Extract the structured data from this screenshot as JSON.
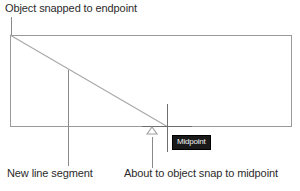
{
  "canvas": {
    "background_color": "#ffffff",
    "width": 300,
    "height": 191
  },
  "annotations": {
    "top_label": "Object snapped to endpoint",
    "bottom_left_label": "New line segment",
    "bottom_right_label": "About to object snap to midpoint"
  },
  "drawing": {
    "rectangle_name": "rectangle-object",
    "diagonal_name": "new-line-segment",
    "stroke_color": "#9a9a9a",
    "diagonal_color": "#a8a8a8"
  },
  "cursor": {
    "crosshair_color": "#6e6e6e",
    "snap_marker_icon": "midpoint-triangle-icon"
  },
  "tooltip": {
    "text": "Midpoint",
    "background_color": "#1a1a1a",
    "text_color": "#f2f2f2"
  }
}
